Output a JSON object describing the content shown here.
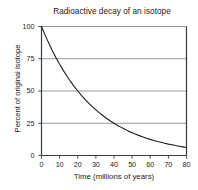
{
  "chart_data": {
    "type": "line",
    "title": "Radioactive decay of an isotope",
    "xlabel": "Time (millions of years)",
    "ylabel": "Percent of original isotope",
    "xlim": [
      0,
      80
    ],
    "ylim": [
      0,
      100
    ],
    "xticks": [
      0,
      10,
      20,
      30,
      40,
      50,
      60,
      70,
      80
    ],
    "yticks": [
      0,
      25,
      50,
      75,
      100
    ],
    "xtick_labels": [
      "0",
      "10",
      "20",
      "30",
      "40",
      "50",
      "60",
      "70",
      "80"
    ],
    "ytick_labels": [
      "0",
      "25",
      "50",
      "75",
      "100"
    ],
    "grid": "horizontal",
    "grid_color": "#999999",
    "legend": null,
    "line_color": "#1a1a1a",
    "axis_color": "#3a3a3a",
    "background_color": "#ffffff",
    "half_life": 20,
    "series": [
      {
        "name": "Percent of original isotope remaining",
        "x": [
          0,
          2,
          4,
          6,
          8,
          10,
          12,
          14,
          16,
          18,
          20,
          22,
          24,
          26,
          28,
          30,
          32,
          34,
          36,
          38,
          40,
          42,
          44,
          46,
          48,
          50,
          52,
          54,
          56,
          58,
          60,
          62,
          64,
          66,
          68,
          70,
          72,
          74,
          76,
          78,
          80
        ],
        "y": [
          100,
          93.3,
          87.1,
          81.2,
          75.8,
          70.7,
          66,
          61.6,
          57.4,
          53.6,
          50,
          46.6,
          43.5,
          40.6,
          37.9,
          35.4,
          33,
          30.8,
          28.7,
          26.8,
          25,
          23.3,
          21.8,
          20.3,
          18.9,
          17.7,
          16.5,
          15.4,
          14.4,
          13.4,
          12.5,
          11.7,
          10.9,
          10.2,
          9.5,
          8.8,
          8.3,
          7.7,
          7.2,
          6.7,
          6.25
        ]
      }
    ]
  }
}
